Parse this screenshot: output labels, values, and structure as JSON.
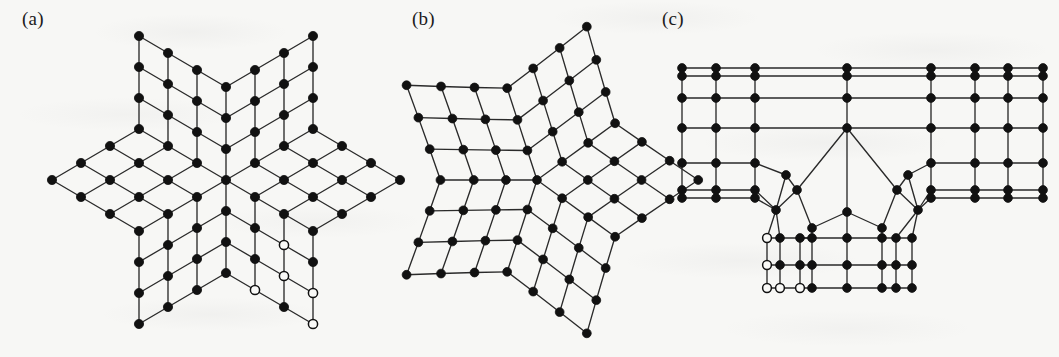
{
  "figure": {
    "width": 1059,
    "height": 357,
    "background_color": "#f7f7f5",
    "ink_color": "#111111",
    "edge_color": "#2a2a2a",
    "open_node_fill": "#f9f9f7",
    "caption_style": "parenthesized-lowercase-letter"
  },
  "panels": [
    {
      "id": "a",
      "label": "(a)",
      "label_x": 22,
      "label_y": 8,
      "origin_x": 0,
      "origin_y": 0,
      "node_radius": 4.6,
      "node_counts": {
        "filled": 68,
        "open": 4,
        "total": 72
      },
      "nodes": [
        {
          "x": 140,
          "y": 28,
          "open": false
        },
        {
          "x": 312,
          "y": 28,
          "open": false
        },
        {
          "x": 169,
          "y": 45,
          "open": false
        },
        {
          "x": 283,
          "y": 45,
          "open": false
        },
        {
          "x": 140,
          "y": 59,
          "open": false
        },
        {
          "x": 312,
          "y": 59,
          "open": false
        },
        {
          "x": 197,
          "y": 62,
          "open": false
        },
        {
          "x": 255,
          "y": 62,
          "open": false
        },
        {
          "x": 226,
          "y": 79,
          "open": false
        },
        {
          "x": 169,
          "y": 76,
          "open": false
        },
        {
          "x": 283,
          "y": 76,
          "open": false
        },
        {
          "x": 140,
          "y": 90,
          "open": false
        },
        {
          "x": 312,
          "y": 90,
          "open": false
        },
        {
          "x": 197,
          "y": 93,
          "open": false
        },
        {
          "x": 255,
          "y": 93,
          "open": false
        },
        {
          "x": 226,
          "y": 110,
          "open": false
        },
        {
          "x": 169,
          "y": 107,
          "open": false
        },
        {
          "x": 283,
          "y": 107,
          "open": false
        },
        {
          "x": 140,
          "y": 121,
          "open": false
        },
        {
          "x": 312,
          "y": 121,
          "open": false
        },
        {
          "x": 197,
          "y": 124,
          "open": false
        },
        {
          "x": 255,
          "y": 124,
          "open": false
        },
        {
          "x": 111,
          "y": 138,
          "open": false
        },
        {
          "x": 341,
          "y": 138,
          "open": false
        },
        {
          "x": 226,
          "y": 141,
          "open": false
        },
        {
          "x": 169,
          "y": 138,
          "open": false
        },
        {
          "x": 283,
          "y": 138,
          "open": false
        },
        {
          "x": 82,
          "y": 155,
          "open": false
        },
        {
          "x": 370,
          "y": 155,
          "open": false
        },
        {
          "x": 140,
          "y": 152,
          "open": false
        },
        {
          "x": 312,
          "y": 152,
          "open": false
        },
        {
          "x": 197,
          "y": 155,
          "open": false
        },
        {
          "x": 255,
          "y": 155,
          "open": false
        },
        {
          "x": 52,
          "y": 180,
          "open": false
        },
        {
          "x": 400,
          "y": 180,
          "open": false
        },
        {
          "x": 111,
          "y": 169,
          "open": false
        },
        {
          "x": 341,
          "y": 169,
          "open": false
        },
        {
          "x": 169,
          "y": 169,
          "open": false
        },
        {
          "x": 283,
          "y": 169,
          "open": false
        },
        {
          "x": 226,
          "y": 180,
          "open": false
        },
        {
          "x": 82,
          "y": 197,
          "open": false
        },
        {
          "x": 370,
          "y": 197,
          "open": false
        },
        {
          "x": 140,
          "y": 197,
          "open": false
        },
        {
          "x": 312,
          "y": 197,
          "open": false
        },
        {
          "x": 197,
          "y": 197,
          "open": false
        },
        {
          "x": 255,
          "y": 197,
          "open": false
        },
        {
          "x": 111,
          "y": 214,
          "open": false
        },
        {
          "x": 341,
          "y": 214,
          "open": false
        },
        {
          "x": 169,
          "y": 214,
          "open": false
        },
        {
          "x": 283,
          "y": 214,
          "open": false
        },
        {
          "x": 226,
          "y": 211,
          "open": false
        },
        {
          "x": 140,
          "y": 231,
          "open": false
        },
        {
          "x": 312,
          "y": 231,
          "open": false
        },
        {
          "x": 197,
          "y": 228,
          "open": false
        },
        {
          "x": 255,
          "y": 228,
          "open": false
        },
        {
          "x": 226,
          "y": 242,
          "open": false
        },
        {
          "x": 169,
          "y": 245,
          "open": false
        },
        {
          "x": 283,
          "y": 245,
          "open": true
        },
        {
          "x": 140,
          "y": 262,
          "open": false
        },
        {
          "x": 312,
          "y": 262,
          "open": false
        },
        {
          "x": 197,
          "y": 259,
          "open": false
        },
        {
          "x": 255,
          "y": 259,
          "open": false
        },
        {
          "x": 226,
          "y": 273,
          "open": false
        },
        {
          "x": 169,
          "y": 276,
          "open": false
        },
        {
          "x": 283,
          "y": 276,
          "open": true
        },
        {
          "x": 140,
          "y": 293,
          "open": false
        },
        {
          "x": 312,
          "y": 293,
          "open": true
        },
        {
          "x": 197,
          "y": 290,
          "open": false
        },
        {
          "x": 255,
          "y": 290,
          "open": true
        },
        {
          "x": 226,
          "y": 304,
          "open": false
        },
        {
          "x": 169,
          "y": 307,
          "open": false
        },
        {
          "x": 283,
          "y": 307,
          "open": false
        },
        {
          "x": 140,
          "y": 324,
          "open": false
        },
        {
          "x": 312,
          "y": 324,
          "open": true
        }
      ]
    },
    {
      "id": "b",
      "label": "(b)",
      "label_x": 412,
      "label_y": 8,
      "center_x": 537,
      "center_y": 180,
      "node_radius": 4.4,
      "symmetry": 5,
      "node_counts": {
        "filled": 86,
        "open": 0,
        "total": 86
      },
      "ring_radii": [
        0,
        42,
        64,
        88,
        112,
        136,
        152
      ],
      "outer_vertex_radius": 155
    },
    {
      "id": "c",
      "label": "(c)",
      "label_x": 662,
      "label_y": 8,
      "node_radius": 4.4,
      "node_counts": {
        "filled": 78,
        "open": 5,
        "total": 83
      },
      "grid_columns_x": [
        682,
        716,
        755,
        846,
        892,
        931,
        975,
        1008,
        1043
      ],
      "grid_rows_y": [
        68,
        76,
        98,
        128,
        163,
        190,
        198
      ],
      "bottom_rows_y": [
        214,
        238,
        265,
        288
      ],
      "notch_apex": {
        "x": 847,
        "y": 128
      },
      "notch_mid": {
        "x": 847,
        "y": 212
      }
    }
  ]
}
